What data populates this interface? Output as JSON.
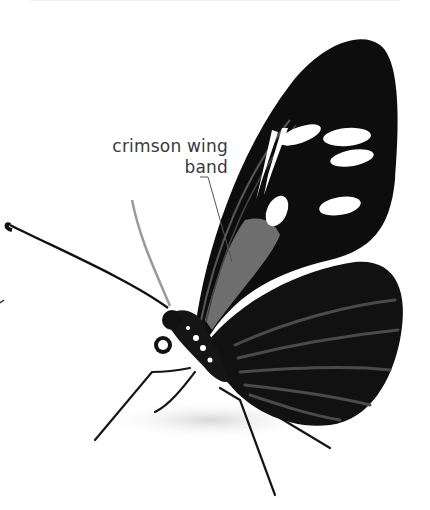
{
  "image": {
    "subject": "butterfly",
    "background_color": "#ffffff",
    "wing_color": "#0d0d0d",
    "spot_color": "#ffffff",
    "band_color": "#6e6e6e"
  },
  "annotation": {
    "line1": "crimson wing",
    "line2": "band"
  }
}
